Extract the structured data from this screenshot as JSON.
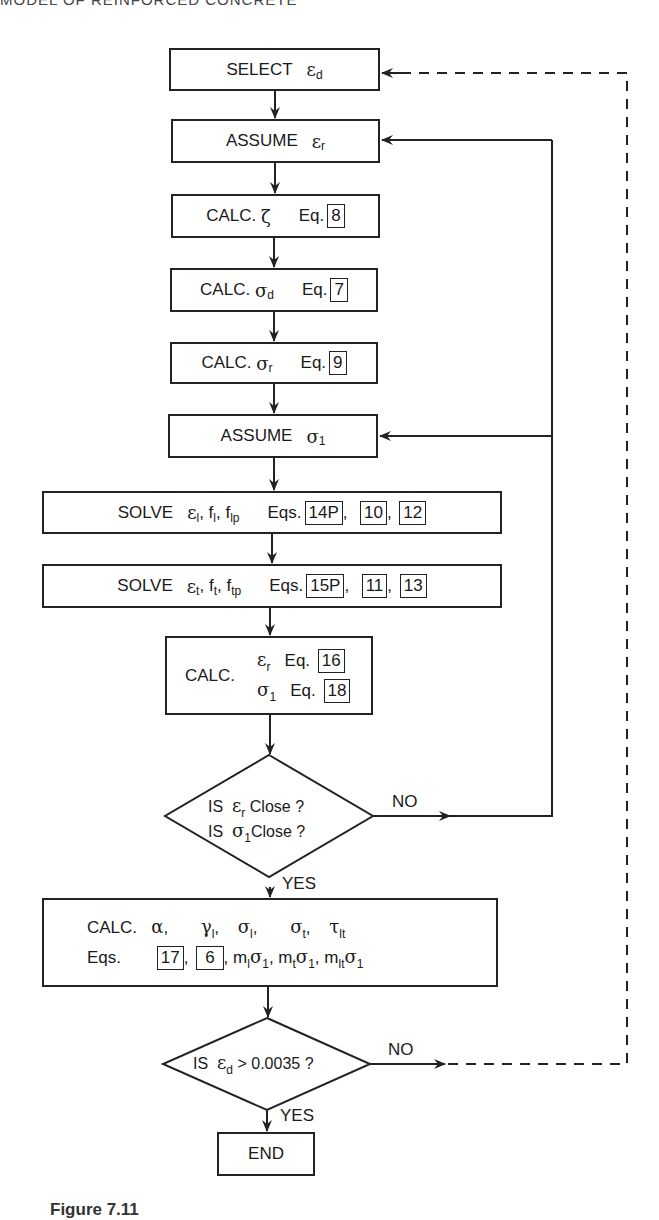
{
  "header": {
    "running_title": "MODEL OF REINFORCED CONCRETE"
  },
  "flowchart": {
    "select": {
      "verb": "SELECT",
      "symbol": "ε",
      "sub": "d"
    },
    "assume_er": {
      "verb": "ASSUME",
      "symbol": "ε",
      "sub": "r"
    },
    "calc_zeta": {
      "verb": "CALC.",
      "symbol": "ζ",
      "eq_label": "Eq.",
      "eq": "8"
    },
    "calc_sd": {
      "verb": "CALC.",
      "symbol": "σ",
      "sub": "d",
      "eq_label": "Eq.",
      "eq": "7"
    },
    "calc_sr": {
      "verb": "CALC.",
      "symbol": "σ",
      "sub": "r",
      "eq_label": "Eq.",
      "eq": "9"
    },
    "assume_s1": {
      "verb": "ASSUME",
      "symbol": "σ",
      "sub": "1"
    },
    "solve_l": {
      "verb": "SOLVE",
      "vars": [
        {
          "symbol": "ε",
          "sub": "l"
        },
        {
          "symbol": "f",
          "sub": "l"
        },
        {
          "symbol": "f",
          "sub": "lp"
        }
      ],
      "eq_label": "Eqs.",
      "eqs": [
        "14P",
        "10",
        "12"
      ]
    },
    "solve_t": {
      "verb": "SOLVE",
      "vars": [
        {
          "symbol": "ε",
          "sub": "t"
        },
        {
          "symbol": "f",
          "sub": "t"
        },
        {
          "symbol": "f",
          "sub": "tp"
        }
      ],
      "eq_label": "Eqs.",
      "eqs": [
        "15P",
        "11",
        "13"
      ]
    },
    "calc_er_s1": {
      "verb": "CALC.",
      "rows": [
        {
          "symbol": "ε",
          "sub": "r",
          "eq_label": "Eq.",
          "eq": "16"
        },
        {
          "symbol": "σ",
          "sub": "1",
          "eq_label": "Eq.",
          "eq": "18"
        }
      ]
    },
    "decision_close": {
      "line1": {
        "prefix": "IS",
        "symbol": "ε",
        "sub": "r",
        "suffix": "Close ?"
      },
      "line2": {
        "prefix": "IS",
        "symbol": "σ",
        "sub": "1",
        "suffix": "Close ?"
      },
      "no_label": "NO",
      "yes_label": "YES"
    },
    "calc_final": {
      "verb": "CALC.",
      "vars": [
        {
          "symbol": "α",
          "sub": ""
        },
        {
          "symbol": "γ",
          "sub": "l"
        },
        {
          "symbol": "σ",
          "sub": "l"
        },
        {
          "symbol": "σ",
          "sub": "t"
        },
        {
          "symbol": "τ",
          "sub": "lt"
        }
      ],
      "eq_label": "Eqs.",
      "eqs": [
        "17",
        "6"
      ],
      "products": [
        {
          "m": "m",
          "msub": "l",
          "s": "σ",
          "ssub": "1"
        },
        {
          "m": "m",
          "msub": "t",
          "s": "σ",
          "ssub": "1"
        },
        {
          "m": "m",
          "msub": "lt",
          "s": "σ",
          "ssub": "1"
        }
      ]
    },
    "decision_ed": {
      "prefix": "IS",
      "symbol": "ε",
      "sub": "d",
      "suffix": "> 0.0035 ?",
      "no_label": "NO",
      "yes_label": "YES"
    },
    "end": {
      "label": "END"
    }
  },
  "caption": {
    "text": "Figure 7.11"
  },
  "colors": {
    "line": "#222222",
    "background": "#ffffff"
  }
}
